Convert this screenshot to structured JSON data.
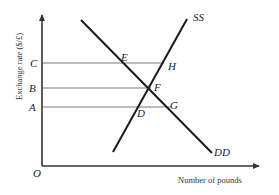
{
  "diagram": {
    "type": "supply-demand",
    "y_axis_label": "Exchange rate ($/£)",
    "x_axis_label": "Number of pounds",
    "origin_label": "O",
    "price_levels": [
      {
        "label": "C",
        "y": 63,
        "to_x": 164
      },
      {
        "label": "B",
        "y": 88,
        "to_x": 151
      },
      {
        "label": "A",
        "y": 107,
        "to_x": 172
      }
    ],
    "curves": {
      "demand": {
        "label": "DD",
        "x1": 81,
        "y1": 20,
        "x2": 212,
        "y2": 153
      },
      "supply": {
        "label": "SS",
        "x1": 113,
        "y1": 152,
        "x2": 187,
        "y2": 19
      }
    },
    "points": [
      {
        "label": "E",
        "x": 121,
        "y": 61
      },
      {
        "label": "H",
        "x": 168,
        "y": 69
      },
      {
        "label": "F",
        "x": 153,
        "y": 90
      },
      {
        "label": "G",
        "x": 171,
        "y": 108
      },
      {
        "label": "D",
        "x": 137,
        "y": 117
      }
    ],
    "colors": {
      "curve": "#1a1a1a",
      "axis": "#333333",
      "guide": "#555555"
    }
  }
}
